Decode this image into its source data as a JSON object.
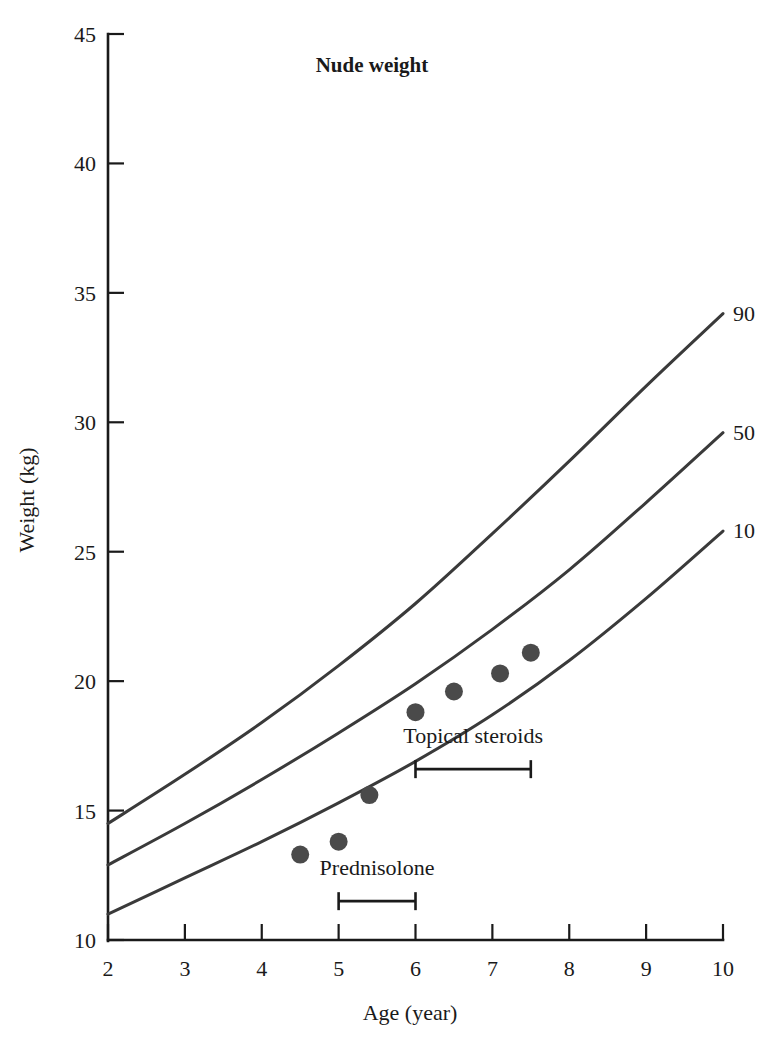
{
  "chart_data": {
    "type": "line",
    "title": "Nude weight",
    "xlabel": "Age (year)",
    "ylabel": "Weight (kg)",
    "xlim": [
      2,
      10
    ],
    "ylim": [
      10,
      45
    ],
    "xticks": [
      "2",
      "3",
      "4",
      "5",
      "6",
      "7",
      "8",
      "9",
      "10"
    ],
    "yticks": [
      "10",
      "15",
      "20",
      "25",
      "30",
      "35",
      "40",
      "45"
    ],
    "grid": false,
    "legend_position": "right-inline",
    "series": [
      {
        "name": "90",
        "label": "90",
        "x": [
          2,
          3,
          4,
          5,
          6,
          7,
          8,
          9,
          10
        ],
        "values": [
          14.5,
          16.4,
          18.4,
          20.6,
          23.0,
          25.7,
          28.5,
          31.4,
          34.2
        ]
      },
      {
        "name": "50",
        "label": "50",
        "x": [
          2,
          3,
          4,
          5,
          6,
          7,
          8,
          9,
          10
        ],
        "values": [
          12.9,
          14.5,
          16.2,
          18.0,
          19.9,
          22.0,
          24.3,
          26.9,
          29.6
        ]
      },
      {
        "name": "10",
        "label": "10",
        "x": [
          2,
          3,
          4,
          5,
          6,
          7,
          8,
          9,
          10
        ],
        "values": [
          11.0,
          12.4,
          13.8,
          15.3,
          16.9,
          18.7,
          20.8,
          23.2,
          25.8
        ]
      }
    ],
    "scatter": {
      "name": "patient-weight",
      "points": [
        {
          "x": 4.5,
          "y": 13.3
        },
        {
          "x": 5.0,
          "y": 13.8
        },
        {
          "x": 5.4,
          "y": 15.6
        },
        {
          "x": 6.0,
          "y": 18.8
        },
        {
          "x": 6.5,
          "y": 19.6
        },
        {
          "x": 7.1,
          "y": 20.3
        },
        {
          "x": 7.5,
          "y": 21.1
        }
      ],
      "marker_color": "#4a4a4a"
    },
    "annotations": [
      {
        "name": "topical-steroids",
        "label": "Topical steroids",
        "x_start": 6.0,
        "x_end": 7.5,
        "y": 16.6,
        "label_y": 17.6
      },
      {
        "name": "prednisolone",
        "label": "Prednisolone",
        "x_start": 5.0,
        "x_end": 6.0,
        "y": 11.5,
        "label_y": 12.5
      }
    ],
    "colors": {
      "curve": "#3a3a3a",
      "marker": "#4a4a4a",
      "axis": "#1a1a1a",
      "background": "#ffffff"
    }
  }
}
